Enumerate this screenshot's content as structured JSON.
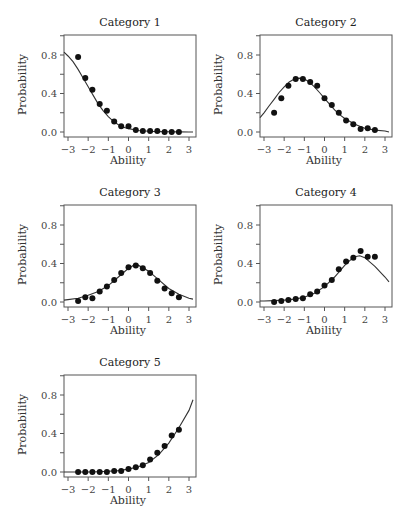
{
  "figure": {
    "xlabel": "Ability",
    "ylabel": "Probability",
    "x_ticks": [
      "-3",
      "-2",
      "-1",
      "0",
      "1",
      "2",
      "3"
    ],
    "y_ticks": [
      "0.0",
      "0.4",
      "0.8"
    ]
  },
  "panels": [
    {
      "title": "Category 1"
    },
    {
      "title": "Category 2"
    },
    {
      "title": "Category 3"
    },
    {
      "title": "Category 4"
    },
    {
      "title": "Category 5"
    }
  ],
  "chart_data": [
    {
      "type": "scatter",
      "title": "Category 1",
      "xlabel": "Ability",
      "ylabel": "Probability",
      "xlim": [
        -3.2,
        3.2
      ],
      "ylim": [
        -0.03,
        1.02
      ],
      "x_ticks": [
        -3,
        -2,
        -1,
        0,
        1,
        2,
        3
      ],
      "y_ticks": [
        0.0,
        0.4,
        0.8
      ],
      "points_x": [
        -2.5,
        -2.14,
        -1.79,
        -1.43,
        -1.07,
        -0.71,
        -0.36,
        0.0,
        0.36,
        0.71,
        1.07,
        1.43,
        1.79,
        2.14,
        2.5
      ],
      "points_y": [
        0.78,
        0.56,
        0.44,
        0.29,
        0.22,
        0.11,
        0.06,
        0.06,
        0.02,
        0.01,
        0.01,
        0.01,
        0.0,
        0.0,
        0.0
      ],
      "curve": "model",
      "curve_x": [
        -3.2,
        -3.0,
        -2.75,
        -2.5,
        -2.25,
        -2.0,
        -1.75,
        -1.5,
        -1.25,
        -1.0,
        -0.75,
        -0.5,
        -0.25,
        0.0,
        0.5,
        1.0,
        1.5,
        2.0,
        2.5,
        3.0,
        3.2
      ],
      "curve_y": [
        0.83,
        0.79,
        0.73,
        0.65,
        0.56,
        0.47,
        0.38,
        0.29,
        0.22,
        0.16,
        0.11,
        0.075,
        0.05,
        0.035,
        0.016,
        0.008,
        0.004,
        0.002,
        0.001,
        0.0,
        0.0
      ]
    },
    {
      "type": "scatter",
      "title": "Category 2",
      "xlabel": "Ability",
      "ylabel": "Probability",
      "xlim": [
        -3.2,
        3.2
      ],
      "ylim": [
        -0.03,
        1.02
      ],
      "x_ticks": [
        -3,
        -2,
        -1,
        0,
        1,
        2,
        3
      ],
      "y_ticks": [
        0.0,
        0.4,
        0.8
      ],
      "points_x": [
        -2.5,
        -2.14,
        -1.79,
        -1.43,
        -1.07,
        -0.71,
        -0.36,
        0.0,
        0.36,
        0.71,
        1.07,
        1.43,
        1.79,
        2.14,
        2.5
      ],
      "points_y": [
        0.2,
        0.35,
        0.48,
        0.55,
        0.55,
        0.52,
        0.48,
        0.35,
        0.28,
        0.2,
        0.12,
        0.08,
        0.03,
        0.04,
        0.02
      ],
      "curve": "model",
      "curve_x": [
        -3.2,
        -3.0,
        -2.75,
        -2.5,
        -2.25,
        -2.0,
        -1.75,
        -1.5,
        -1.25,
        -1.0,
        -0.75,
        -0.5,
        -0.25,
        0.0,
        0.25,
        0.5,
        0.75,
        1.0,
        1.5,
        2.0,
        2.5,
        3.0,
        3.2
      ],
      "curve_y": [
        0.15,
        0.2,
        0.27,
        0.34,
        0.41,
        0.47,
        0.52,
        0.55,
        0.56,
        0.55,
        0.52,
        0.47,
        0.41,
        0.35,
        0.29,
        0.23,
        0.18,
        0.14,
        0.08,
        0.04,
        0.02,
        0.01,
        0.0
      ]
    },
    {
      "type": "scatter",
      "title": "Category 3",
      "xlabel": "Ability",
      "ylabel": "Probability",
      "xlim": [
        -3.2,
        3.2
      ],
      "ylim": [
        -0.03,
        1.02
      ],
      "x_ticks": [
        -3,
        -2,
        -1,
        0,
        1,
        2,
        3
      ],
      "y_ticks": [
        0.0,
        0.4,
        0.8
      ],
      "points_x": [
        -2.5,
        -2.14,
        -1.79,
        -1.43,
        -1.07,
        -0.71,
        -0.36,
        0.0,
        0.36,
        0.71,
        1.07,
        1.43,
        1.79,
        2.14,
        2.5
      ],
      "points_y": [
        0.01,
        0.05,
        0.04,
        0.11,
        0.16,
        0.23,
        0.3,
        0.36,
        0.38,
        0.35,
        0.3,
        0.22,
        0.14,
        0.09,
        0.05
      ],
      "curve": "model",
      "curve_x": [
        -3.2,
        -3.0,
        -2.5,
        -2.0,
        -1.5,
        -1.0,
        -0.5,
        0.0,
        0.25,
        0.5,
        1.0,
        1.5,
        2.0,
        2.5,
        3.0,
        3.2
      ],
      "curve_y": [
        0.02,
        0.025,
        0.04,
        0.07,
        0.11,
        0.17,
        0.26,
        0.35,
        0.38,
        0.38,
        0.32,
        0.23,
        0.14,
        0.08,
        0.04,
        0.03
      ]
    },
    {
      "type": "scatter",
      "title": "Category 4",
      "xlabel": "Ability",
      "ylabel": "Probability",
      "xlim": [
        -3.2,
        3.2
      ],
      "ylim": [
        -0.03,
        1.02
      ],
      "x_ticks": [
        -3,
        -2,
        -1,
        0,
        1,
        2,
        3
      ],
      "y_ticks": [
        0.0,
        0.4,
        0.8
      ],
      "points_x": [
        -2.5,
        -2.14,
        -1.79,
        -1.43,
        -1.07,
        -0.71,
        -0.36,
        0.0,
        0.36,
        0.71,
        1.07,
        1.43,
        1.79,
        2.14,
        2.5
      ],
      "points_y": [
        0.0,
        0.01,
        0.02,
        0.03,
        0.04,
        0.08,
        0.11,
        0.17,
        0.23,
        0.34,
        0.42,
        0.46,
        0.53,
        0.47,
        0.47
      ],
      "curve": "model",
      "curve_x": [
        -3.2,
        -3.0,
        -2.5,
        -2.0,
        -1.5,
        -1.0,
        -0.5,
        0.0,
        0.5,
        1.0,
        1.25,
        1.5,
        1.75,
        2.0,
        2.5,
        3.0,
        3.2
      ],
      "curve_y": [
        0.01,
        0.01,
        0.015,
        0.02,
        0.03,
        0.05,
        0.09,
        0.16,
        0.26,
        0.38,
        0.43,
        0.47,
        0.48,
        0.46,
        0.37,
        0.26,
        0.21
      ]
    },
    {
      "type": "scatter",
      "title": "Category 5",
      "xlabel": "Ability",
      "ylabel": "Probability",
      "xlim": [
        -3.2,
        3.2
      ],
      "ylim": [
        -0.03,
        1.02
      ],
      "x_ticks": [
        -3,
        -2,
        -1,
        0,
        1,
        2,
        3
      ],
      "y_ticks": [
        0.0,
        0.4,
        0.8
      ],
      "points_x": [
        -2.5,
        -2.14,
        -1.79,
        -1.43,
        -1.07,
        -0.71,
        -0.36,
        0.0,
        0.36,
        0.71,
        1.07,
        1.43,
        1.79,
        2.14,
        2.5
      ],
      "points_y": [
        0.0,
        0.0,
        0.0,
        0.0,
        0.0,
        0.01,
        0.01,
        0.03,
        0.05,
        0.07,
        0.13,
        0.2,
        0.27,
        0.38,
        0.44
      ],
      "curve": "model",
      "curve_x": [
        -3.2,
        -3.0,
        -2.5,
        -2.0,
        -1.5,
        -1.0,
        -0.5,
        0.0,
        0.5,
        1.0,
        1.5,
        2.0,
        2.5,
        3.0,
        3.2
      ],
      "curve_y": [
        0.0,
        0.0,
        0.0,
        0.0,
        0.003,
        0.008,
        0.015,
        0.03,
        0.055,
        0.1,
        0.18,
        0.3,
        0.46,
        0.64,
        0.75
      ]
    }
  ]
}
